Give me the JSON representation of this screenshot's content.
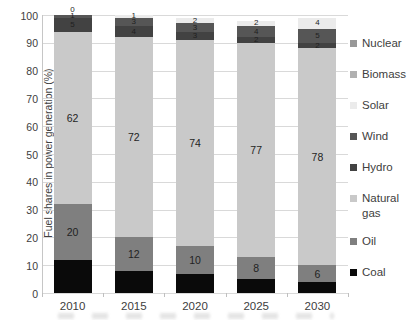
{
  "chart_data": {
    "type": "bar",
    "stacked": true,
    "title": "",
    "xlabel": "",
    "ylabel": "Fuel shares in power generation (%)",
    "ylim": [
      0,
      100
    ],
    "grid": true,
    "legend_position": "right",
    "y_tick_labels": [
      "0",
      "10",
      "20",
      "30",
      "40",
      "50",
      "60",
      "70",
      "80",
      "90",
      "100"
    ],
    "categories": [
      "2010",
      "2015",
      "2020",
      "2025",
      "2030"
    ],
    "series": [
      {
        "name": "Coal",
        "color": "#0a0a0a",
        "values": [
          12,
          8,
          7,
          5,
          4
        ],
        "show_labels": false
      },
      {
        "name": "Oil",
        "color": "#7f7f7f",
        "values": [
          20,
          12,
          10,
          8,
          6
        ],
        "show_labels": true
      },
      {
        "name": "Natural gas",
        "color": "#c9c9c9",
        "values": [
          62,
          72,
          74,
          77,
          78
        ],
        "show_labels": true
      },
      {
        "name": "Hydro",
        "color": "#424242",
        "values": [
          5,
          4,
          3,
          2,
          2
        ],
        "show_labels": true
      },
      {
        "name": "Wind",
        "color": "#565656",
        "values": [
          1,
          3,
          3,
          4,
          5
        ],
        "show_labels": true
      },
      {
        "name": "Solar",
        "color": "#ebebeb",
        "values": [
          0,
          1,
          2,
          2,
          4
        ],
        "show_labels": true
      },
      {
        "name": "Biomass",
        "color": "#b0b0b0",
        "values": [
          0,
          0,
          0,
          0,
          0
        ],
        "show_labels": false
      },
      {
        "name": "Nuclear",
        "color": "#989898",
        "values": [
          0,
          0,
          0,
          0,
          0
        ],
        "show_labels": false
      }
    ],
    "legend_order_top_to_bottom": [
      "Nuclear",
      "Biomass",
      "Solar",
      "Wind",
      "Hydro",
      "Natural gas",
      "Oil",
      "Coal"
    ]
  }
}
